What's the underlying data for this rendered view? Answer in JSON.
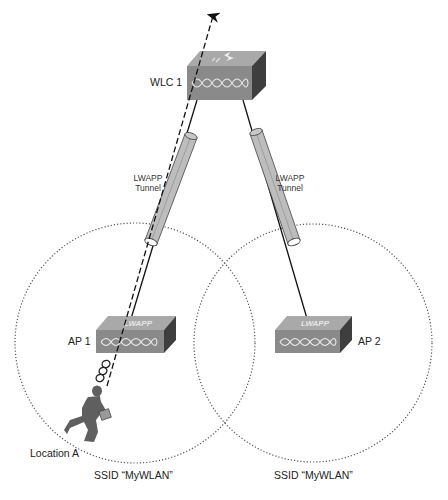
{
  "devices": {
    "wlc": {
      "label": "WLC 1",
      "type": "wireless-lan-controller"
    },
    "ap1": {
      "label": "AP 1",
      "badge": "LWAPP",
      "type": "lightweight-access-point"
    },
    "ap2": {
      "label": "AP 2",
      "badge": "LWAPP",
      "type": "lightweight-access-point"
    }
  },
  "tunnels": [
    {
      "line1": "LWAPP",
      "line2": "Tunnel"
    },
    {
      "line1": "LWAPP",
      "line2": "Tunnel"
    }
  ],
  "cells": [
    {
      "ssid_label": "SSID “MyWLAN”"
    },
    {
      "ssid_label": "SSID “MyWLAN”"
    }
  ],
  "client": {
    "location_label": "Location A"
  },
  "colors": {
    "device_front": "#8a8a8a",
    "device_top": "#a9a9a9",
    "device_side": "#3e3e3e",
    "tunnel_fill": "#b9b9b9",
    "person": "#5f5f5f"
  }
}
